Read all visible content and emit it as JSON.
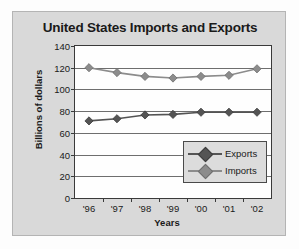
{
  "chart_data": {
    "type": "line",
    "title": "United States Imports and Exports",
    "xlabel": "Years",
    "ylabel": "Billions of dollars",
    "categories": [
      "'96",
      "'97",
      "'98",
      "'99",
      "'00",
      "'01",
      "'02"
    ],
    "yticks": [
      0,
      20,
      40,
      60,
      80,
      100,
      120,
      140
    ],
    "ylim": [
      0,
      140
    ],
    "grid": true,
    "legend_position": "inside-lower-right",
    "series": [
      {
        "name": "Exports",
        "color": "#545454",
        "marker": "diamond",
        "values": [
          71,
          73,
          76.5,
          77,
          79,
          79,
          79
        ]
      },
      {
        "name": "Imports",
        "color": "#8c8c8c",
        "marker": "diamond",
        "values": [
          120,
          115.5,
          112,
          110.5,
          112,
          113,
          119
        ]
      }
    ]
  },
  "legend": {
    "entries": [
      {
        "label": "Exports"
      },
      {
        "label": "Imports"
      }
    ]
  },
  "colors": {
    "panel_background": "#d9d9d9",
    "plot_background": "#fefefe",
    "axis": "#3a3a3a",
    "gridline": "#6e6e6e",
    "exports": "#545454",
    "imports": "#8c8c8c"
  }
}
